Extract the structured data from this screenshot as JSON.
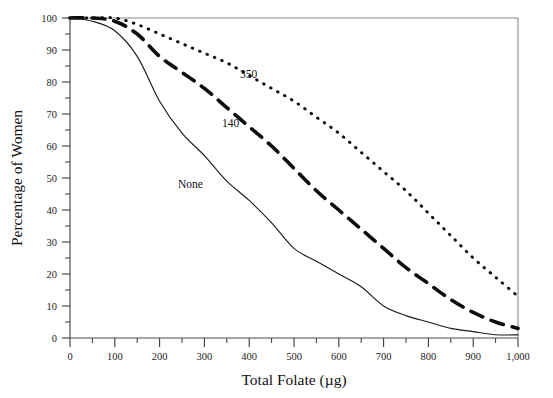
{
  "chart_data": {
    "type": "line",
    "title": "",
    "xlabel": "Total Folate (µg)",
    "ylabel": "Percentage of Women",
    "xlim": [
      0,
      1000
    ],
    "ylim": [
      0,
      100
    ],
    "xticks": [
      0,
      100,
      200,
      300,
      400,
      500,
      600,
      700,
      800,
      900,
      1000
    ],
    "xticklabels": [
      "0",
      "100",
      "200",
      "300",
      "400",
      "500",
      "600",
      "700",
      "800",
      "900",
      "1,000"
    ],
    "yticks": [
      0,
      10,
      20,
      30,
      40,
      50,
      60,
      70,
      80,
      90,
      100
    ],
    "yticklabels": [
      "0",
      "10",
      "20",
      "30",
      "40",
      "50",
      "60",
      "70",
      "80",
      "90",
      "100"
    ],
    "grid": false,
    "legend_position": "inline-annotations",
    "x": [
      0,
      50,
      100,
      150,
      200,
      250,
      300,
      350,
      400,
      450,
      500,
      550,
      600,
      650,
      700,
      750,
      800,
      850,
      900,
      950,
      1000
    ],
    "series": [
      {
        "name": "None",
        "label": "None",
        "style": "solid",
        "color": "#1c1c1c",
        "values": [
          100,
          99,
          96,
          88,
          74,
          64,
          57,
          49,
          43,
          36,
          28,
          24,
          20,
          16,
          10,
          7,
          5,
          3,
          2,
          1,
          1
        ],
        "label_xy": [
          330,
          46
        ]
      },
      {
        "name": "140",
        "label": "140",
        "style": "dashed",
        "color": "#0d0d0d",
        "values": [
          100,
          100,
          99,
          95,
          88,
          83,
          78,
          72,
          66,
          60,
          53,
          46,
          40,
          34,
          28,
          22,
          17,
          12,
          8,
          5,
          3
        ],
        "label_xy": [
          358,
          67
        ]
      },
      {
        "name": "350",
        "label": "350",
        "style": "dotted",
        "color": "#0d0d0d",
        "values": [
          100,
          100,
          100,
          98,
          95,
          92,
          89,
          86,
          82,
          78,
          74,
          69,
          64,
          58,
          52,
          46,
          39,
          32,
          25,
          19,
          13
        ],
        "label_xy": [
          535,
          82
        ]
      }
    ]
  },
  "annotations": {
    "none_label": "None",
    "dashed_label": "140",
    "dotted_label": "350"
  }
}
